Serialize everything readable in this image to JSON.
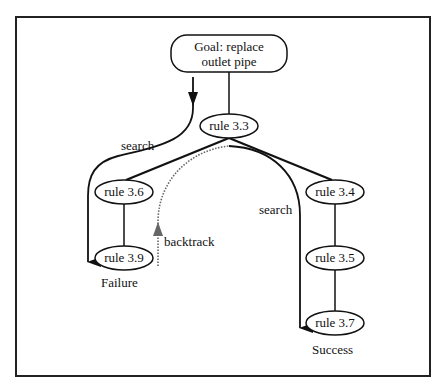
{
  "diagram": {
    "type": "search-tree",
    "goal": {
      "line1": "Goal: replace",
      "line2": "outlet pipe"
    },
    "nodes": {
      "rule_3_3": "rule 3.3",
      "rule_3_6": "rule 3.6",
      "rule_3_9": "rule 3.9",
      "rule_3_4": "rule 3.4",
      "rule_3_5": "rule 3.5",
      "rule_3_7": "rule 3.7"
    },
    "edges": [
      [
        "Goal",
        "rule 3.3"
      ],
      [
        "rule 3.3",
        "rule 3.6"
      ],
      [
        "rule 3.3",
        "rule 3.4"
      ],
      [
        "rule 3.6",
        "rule 3.9"
      ],
      [
        "rule 3.4",
        "rule 3.5"
      ],
      [
        "rule 3.5",
        "rule 3.7"
      ]
    ],
    "labels": {
      "search_left": "search",
      "backtrack": "backtrack",
      "search_right": "search",
      "failure": "Failure",
      "success": "Success"
    },
    "colors": {
      "line": "#111111",
      "backtrack": "#666666",
      "background": "#ffffff"
    }
  }
}
